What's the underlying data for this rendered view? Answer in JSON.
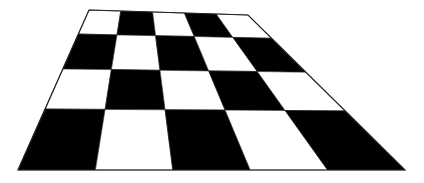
{
  "scene": {
    "title": "Checkerboard in perspective",
    "background": "#ffffff",
    "dark_color": "#000000",
    "light_color": "#ffffff",
    "outline_color": "#222222",
    "columns": 5,
    "rows": 4,
    "corners": {
      "top_left": [
        89,
        10
      ],
      "top_right": [
        248,
        15
      ],
      "bottom_right": [
        405,
        170
      ],
      "bottom_left": [
        18,
        170
      ]
    },
    "row_lines_y": [
      10,
      34,
      69,
      109,
      170
    ],
    "pattern": [
      [
        "W",
        "B",
        "W",
        "B",
        "W"
      ],
      [
        "B",
        "W",
        "B",
        "W",
        "B"
      ],
      [
        "W",
        "B",
        "W",
        "B",
        "W"
      ],
      [
        "B",
        "W",
        "B",
        "W",
        "B"
      ]
    ]
  }
}
